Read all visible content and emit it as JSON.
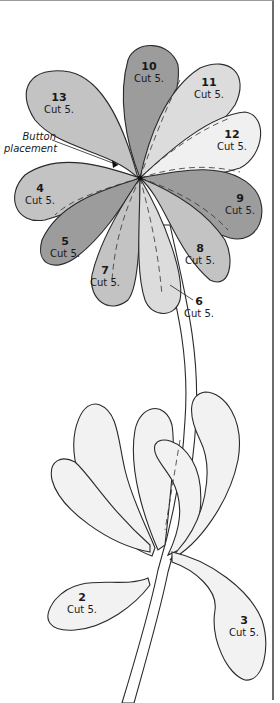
{
  "diagram": {
    "type": "applique-pattern",
    "colors": {
      "dark": "#9c9c9c",
      "medium": "#c3c3c3",
      "light": "#dcdcdc",
      "pale": "#f0f0f0",
      "outline": "#2a2a2a"
    },
    "annotation": {
      "line1": "Button",
      "line2": "placement"
    },
    "pieces": [
      {
        "num": "10",
        "cut": "Cut 5.",
        "shade": "dark"
      },
      {
        "num": "11",
        "cut": "Cut 5.",
        "shade": "light"
      },
      {
        "num": "13",
        "cut": "Cut 5.",
        "shade": "medium"
      },
      {
        "num": "12",
        "cut": "Cut 5.",
        "shade": "pale"
      },
      {
        "num": "4",
        "cut": "Cut 5.",
        "shade": "medium"
      },
      {
        "num": "9",
        "cut": "Cut 5.",
        "shade": "dark"
      },
      {
        "num": "5",
        "cut": "Cut 5.",
        "shade": "dark"
      },
      {
        "num": "8",
        "cut": "Cut 5.",
        "shade": "medium"
      },
      {
        "num": "7",
        "cut": "Cut 5.",
        "shade": "medium"
      },
      {
        "num": "6",
        "cut": "Cut 5.",
        "shade": "light"
      },
      {
        "num": "2",
        "cut": "Cut 5.",
        "shade": "pale"
      },
      {
        "num": "3",
        "cut": "Cut 5.",
        "shade": "pale"
      }
    ]
  }
}
